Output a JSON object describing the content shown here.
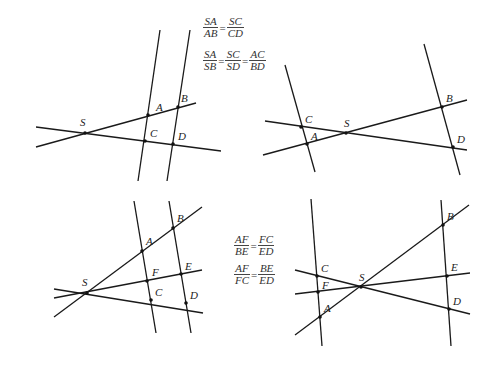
{
  "diagrams": [
    {
      "id": "top-left",
      "lines": [
        {
          "x1": 160,
          "y1": 30,
          "x2": 138,
          "y2": 181
        },
        {
          "x1": 190,
          "y1": 30,
          "x2": 167,
          "y2": 181
        },
        {
          "x1": 36,
          "y1": 147,
          "x2": 196,
          "y2": 103
        },
        {
          "x1": 36,
          "y1": 127,
          "x2": 221,
          "y2": 151
        }
      ],
      "points": [
        {
          "name": "S",
          "x": 85,
          "y": 133,
          "lx": 80,
          "ly": 126
        },
        {
          "name": "A",
          "x": 148,
          "y": 115,
          "lx": 156,
          "ly": 111
        },
        {
          "name": "B",
          "x": 178,
          "y": 107,
          "lx": 181,
          "ly": 102
        },
        {
          "name": "C",
          "x": 145,
          "y": 141,
          "lx": 150,
          "ly": 137
        },
        {
          "name": "D",
          "x": 173,
          "y": 144,
          "lx": 178,
          "ly": 140
        }
      ]
    },
    {
      "id": "top-right",
      "lines": [
        {
          "x1": 285,
          "y1": 65,
          "x2": 315,
          "y2": 172
        },
        {
          "x1": 424,
          "y1": 44,
          "x2": 460,
          "y2": 175
        },
        {
          "x1": 263,
          "y1": 155,
          "x2": 467,
          "y2": 100
        },
        {
          "x1": 265,
          "y1": 121,
          "x2": 467,
          "y2": 150
        }
      ],
      "points": [
        {
          "name": "C",
          "x": 301,
          "y": 127,
          "lx": 305,
          "ly": 123
        },
        {
          "name": "A",
          "x": 307,
          "y": 144,
          "lx": 311,
          "ly": 140
        },
        {
          "name": "S",
          "x": 346,
          "y": 133,
          "lx": 344,
          "ly": 127
        },
        {
          "name": "B",
          "x": 442,
          "y": 107,
          "lx": 446,
          "ly": 102
        },
        {
          "name": "D",
          "x": 453,
          "y": 147,
          "lx": 457,
          "ly": 143
        }
      ]
    },
    {
      "id": "bottom-left",
      "lines": [
        {
          "x1": 134,
          "y1": 201,
          "x2": 156,
          "y2": 333
        },
        {
          "x1": 169,
          "y1": 201,
          "x2": 191,
          "y2": 333
        },
        {
          "x1": 54,
          "y1": 317,
          "x2": 202,
          "y2": 207
        },
        {
          "x1": 54,
          "y1": 298,
          "x2": 202,
          "y2": 270
        },
        {
          "x1": 54,
          "y1": 289,
          "x2": 203,
          "y2": 313
        }
      ],
      "points": [
        {
          "name": "S",
          "x": 87,
          "y": 293,
          "lx": 82,
          "ly": 286
        },
        {
          "name": "A",
          "x": 142,
          "y": 251,
          "lx": 146,
          "ly": 245
        },
        {
          "name": "B",
          "x": 173,
          "y": 228,
          "lx": 177,
          "ly": 222
        },
        {
          "name": "F",
          "x": 147,
          "y": 281,
          "lx": 152,
          "ly": 276
        },
        {
          "name": "E",
          "x": 181,
          "y": 274,
          "lx": 185,
          "ly": 270
        },
        {
          "name": "C",
          "x": 151,
          "y": 300,
          "lx": 155,
          "ly": 296
        },
        {
          "name": "D",
          "x": 186,
          "y": 303,
          "lx": 190,
          "ly": 299
        }
      ]
    },
    {
      "id": "bottom-right",
      "lines": [
        {
          "x1": 311,
          "y1": 199,
          "x2": 322,
          "y2": 346
        },
        {
          "x1": 441,
          "y1": 200,
          "x2": 451,
          "y2": 346
        },
        {
          "x1": 295,
          "y1": 335,
          "x2": 469,
          "y2": 205
        },
        {
          "x1": 295,
          "y1": 294,
          "x2": 470,
          "y2": 273
        },
        {
          "x1": 295,
          "y1": 270,
          "x2": 470,
          "y2": 314
        }
      ],
      "points": [
        {
          "name": "C",
          "x": 317,
          "y": 276,
          "lx": 321,
          "ly": 272
        },
        {
          "name": "F",
          "x": 318,
          "y": 292,
          "lx": 322,
          "ly": 289
        },
        {
          "name": "A",
          "x": 320,
          "y": 317,
          "lx": 324,
          "ly": 312
        },
        {
          "name": "S",
          "x": 361,
          "y": 287,
          "lx": 359,
          "ly": 281
        },
        {
          "name": "B",
          "x": 443,
          "y": 225,
          "lx": 447,
          "ly": 220
        },
        {
          "name": "E",
          "x": 447,
          "y": 276,
          "lx": 451,
          "ly": 271
        },
        {
          "name": "D",
          "x": 449,
          "y": 309,
          "lx": 453,
          "ly": 305
        }
      ]
    }
  ],
  "formulas": {
    "top": {
      "row1": {
        "n1": "SA",
        "d1": "AB",
        "eq": "=",
        "n2": "SC",
        "d2": "CD"
      },
      "row2": {
        "n1": "SA",
        "d1": "SB",
        "eq1": "=",
        "n2": "SC",
        "d2": "SD",
        "eq2": "=",
        "n3": "AC",
        "d3": "BD"
      }
    },
    "bottom": {
      "row1": {
        "n1": "AF",
        "d1": "BE",
        "eq": "=",
        "n2": "FC",
        "d2": "ED"
      },
      "row2": {
        "n1": "AF",
        "d1": "FC",
        "eq": "=",
        "n2": "BE",
        "d2": "ED"
      }
    }
  },
  "colors": {
    "line": "#1a1a1a",
    "point": "#111111",
    "text": "#333333",
    "background": "#ffffff"
  }
}
